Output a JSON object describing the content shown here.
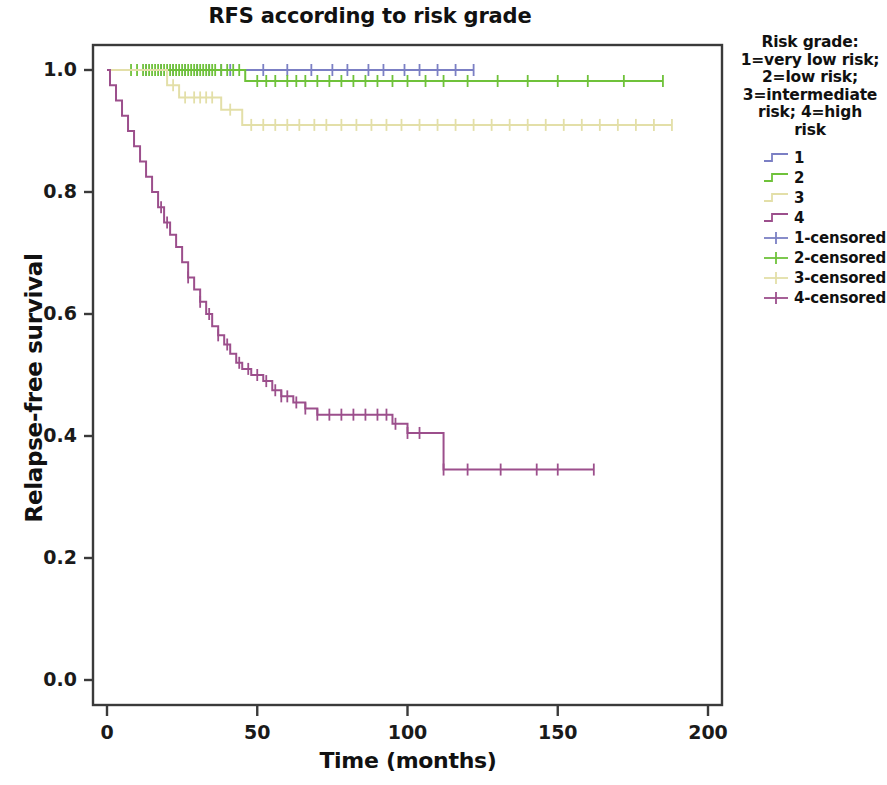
{
  "chart_data": {
    "type": "line",
    "title": "RFS according to risk grade",
    "xlabel": "Time (months)",
    "ylabel": "Relapse-free survival",
    "xlim": [
      0,
      200
    ],
    "ylim": [
      0.0,
      1.0
    ],
    "xticks": [
      "0",
      "50",
      "100",
      "150",
      "200"
    ],
    "xtick_values": [
      0,
      50,
      100,
      150,
      200
    ],
    "yticks": [
      "0.0",
      "0.2",
      "0.4",
      "0.6",
      "0.8",
      "1.0"
    ],
    "ytick_values": [
      0.0,
      0.2,
      0.4,
      0.6,
      0.8,
      1.0
    ],
    "grid": false,
    "legend_position": "right",
    "plot_kind": "kaplan-meier step survival curves with censoring marks",
    "colors": {
      "grade1": "#7b7fc4",
      "grade2": "#6fc23a",
      "grade3": "#e3dfa8",
      "grade4": "#9c4f8c"
    },
    "series": [
      {
        "name": "1",
        "label": "1",
        "color": "#7b7fc4",
        "censored_label": "1-censored",
        "final_survival": 1.0,
        "max_time": 122,
        "steps": [
          [
            0,
            1.0
          ],
          [
            122,
            1.0
          ]
        ],
        "censored": [
          13,
          18,
          22,
          26,
          30,
          34,
          38,
          41,
          52,
          60,
          68,
          75,
          80,
          87,
          92,
          99,
          104,
          110,
          116,
          122
        ]
      },
      {
        "name": "2",
        "label": "2",
        "color": "#6fc23a",
        "censored_label": "2-censored",
        "final_survival": 0.982,
        "max_time": 185,
        "steps": [
          [
            0,
            1.0
          ],
          [
            46,
            1.0
          ],
          [
            46,
            0.982
          ],
          [
            185,
            0.982
          ]
        ],
        "censored": [
          8,
          10,
          12,
          13,
          14,
          15,
          16,
          17,
          18,
          19,
          20,
          21,
          22,
          23,
          24,
          25,
          26,
          27,
          28,
          29,
          30,
          31,
          32,
          33,
          34,
          35,
          36,
          38,
          40,
          42,
          44,
          50,
          53,
          56,
          60,
          63,
          66,
          70,
          74,
          78,
          82,
          86,
          90,
          95,
          100,
          106,
          112,
          120,
          130,
          140,
          150,
          160,
          172,
          185
        ]
      },
      {
        "name": "3",
        "label": "3",
        "color": "#e3dfa8",
        "censored_label": "3-censored",
        "final_survival": 0.91,
        "max_time": 188,
        "steps": [
          [
            0,
            1.0
          ],
          [
            20,
            1.0
          ],
          [
            20,
            0.975
          ],
          [
            24,
            0.975
          ],
          [
            24,
            0.955
          ],
          [
            38,
            0.955
          ],
          [
            38,
            0.935
          ],
          [
            45,
            0.935
          ],
          [
            45,
            0.91
          ],
          [
            188,
            0.91
          ]
        ],
        "censored": [
          22,
          26,
          29,
          31,
          33,
          35,
          41,
          48,
          52,
          56,
          60,
          64,
          69,
          73,
          78,
          83,
          88,
          93,
          98,
          104,
          110,
          116,
          122,
          128,
          134,
          140,
          146,
          152,
          158,
          164,
          170,
          176,
          182,
          188
        ]
      },
      {
        "name": "4",
        "label": "4",
        "color": "#9c4f8c",
        "censored_label": "4-censored",
        "final_survival": 0.345,
        "max_time": 162,
        "steps": [
          [
            0,
            1.0
          ],
          [
            1,
            1.0
          ],
          [
            1,
            0.975
          ],
          [
            3,
            0.975
          ],
          [
            3,
            0.95
          ],
          [
            5,
            0.95
          ],
          [
            5,
            0.925
          ],
          [
            7,
            0.925
          ],
          [
            7,
            0.9
          ],
          [
            9,
            0.9
          ],
          [
            9,
            0.875
          ],
          [
            11,
            0.875
          ],
          [
            11,
            0.85
          ],
          [
            13,
            0.85
          ],
          [
            13,
            0.825
          ],
          [
            15,
            0.825
          ],
          [
            15,
            0.8
          ],
          [
            17,
            0.8
          ],
          [
            17,
            0.775
          ],
          [
            19,
            0.775
          ],
          [
            19,
            0.75
          ],
          [
            21,
            0.75
          ],
          [
            21,
            0.73
          ],
          [
            23,
            0.73
          ],
          [
            23,
            0.71
          ],
          [
            25,
            0.71
          ],
          [
            25,
            0.685
          ],
          [
            27,
            0.685
          ],
          [
            27,
            0.66
          ],
          [
            29,
            0.66
          ],
          [
            29,
            0.64
          ],
          [
            31,
            0.64
          ],
          [
            31,
            0.62
          ],
          [
            33,
            0.62
          ],
          [
            33,
            0.6
          ],
          [
            35,
            0.6
          ],
          [
            35,
            0.58
          ],
          [
            37,
            0.58
          ],
          [
            37,
            0.565
          ],
          [
            39,
            0.565
          ],
          [
            39,
            0.55
          ],
          [
            41,
            0.55
          ],
          [
            41,
            0.535
          ],
          [
            43,
            0.535
          ],
          [
            43,
            0.52
          ],
          [
            45,
            0.52
          ],
          [
            45,
            0.51
          ],
          [
            48,
            0.51
          ],
          [
            48,
            0.5
          ],
          [
            52,
            0.5
          ],
          [
            52,
            0.49
          ],
          [
            55,
            0.49
          ],
          [
            55,
            0.475
          ],
          [
            58,
            0.475
          ],
          [
            58,
            0.465
          ],
          [
            62,
            0.465
          ],
          [
            62,
            0.455
          ],
          [
            66,
            0.455
          ],
          [
            66,
            0.445
          ],
          [
            70,
            0.445
          ],
          [
            70,
            0.435
          ],
          [
            95,
            0.435
          ],
          [
            95,
            0.42
          ],
          [
            100,
            0.42
          ],
          [
            100,
            0.405
          ],
          [
            112,
            0.405
          ],
          [
            112,
            0.345
          ],
          [
            162,
            0.345
          ]
        ],
        "censored": [
          18,
          20,
          27,
          31,
          34,
          37,
          40,
          44,
          47,
          50,
          53,
          56,
          58,
          60,
          63,
          66,
          70,
          74,
          78,
          82,
          86,
          90,
          93,
          96,
          100,
          104,
          112,
          120,
          131,
          143,
          150,
          162
        ]
      }
    ]
  },
  "legend": {
    "title": "Risk grade: 1=very low risk; 2=low risk; 3=intermediate risk; 4=high risk",
    "title_lines": [
      "Risk grade:",
      "1=very low risk;",
      "2=low risk;",
      "3=intermediate",
      "risk; 4=high",
      "risk"
    ],
    "items": [
      {
        "label": "1",
        "color": "#7b7fc4",
        "kind": "step"
      },
      {
        "label": "2",
        "color": "#6fc23a",
        "kind": "step"
      },
      {
        "label": "3",
        "color": "#e3dfa8",
        "kind": "step"
      },
      {
        "label": "4",
        "color": "#9c4f8c",
        "kind": "step"
      },
      {
        "label": "1-censored",
        "color": "#7b7fc4",
        "kind": "censor"
      },
      {
        "label": "2-censored",
        "color": "#6fc23a",
        "kind": "censor"
      },
      {
        "label": "3-censored",
        "color": "#e3dfa8",
        "kind": "censor"
      },
      {
        "label": "4-censored",
        "color": "#9c4f8c",
        "kind": "censor"
      }
    ]
  },
  "axes": {
    "y_title": "Relapse-free survival",
    "x_title": "Time (months)"
  }
}
